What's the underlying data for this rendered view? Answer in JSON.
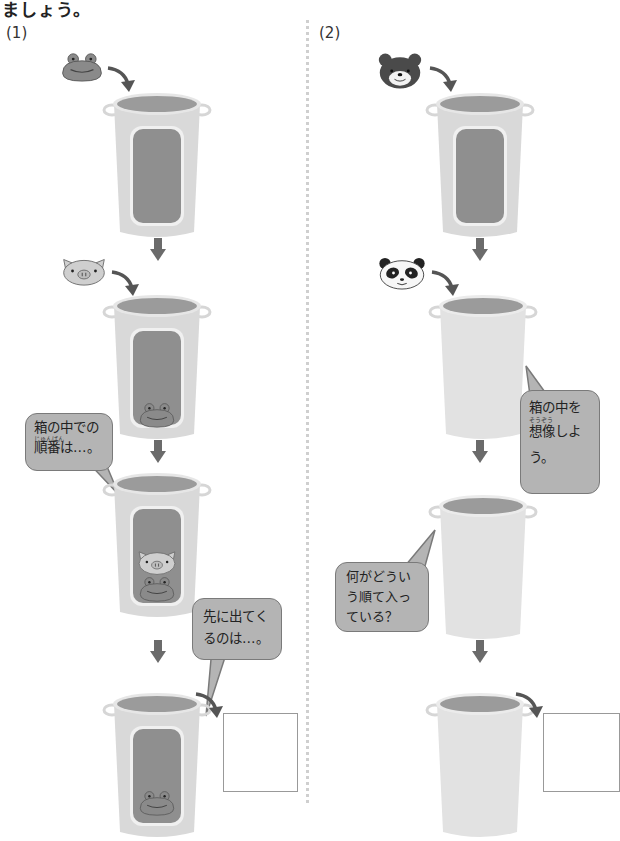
{
  "header": {
    "text": "ましょう。"
  },
  "panels": [
    {
      "label": "(1)",
      "steps": [
        {
          "animal": "frog",
          "action": "goes into box"
        },
        {
          "animal": "pig",
          "action": "goes into box",
          "box_contents": [
            "frog"
          ]
        },
        {
          "box_contents": [
            "frog",
            "pig"
          ]
        },
        {
          "box_contents": [
            "frog"
          ],
          "output": "answer-box"
        }
      ],
      "bubbles": [
        {
          "ruby": "じゅんばん",
          "lines": [
            "箱の中での",
            "順番は…。"
          ]
        },
        {
          "lines": [
            "先に出てく",
            "るのは…。"
          ]
        }
      ]
    },
    {
      "label": "(2)",
      "steps": [
        {
          "animal": "bear",
          "action": "goes into box"
        },
        {
          "animal": "panda",
          "action": "goes into box"
        },
        {
          "box_contents": []
        },
        {
          "box_contents": [],
          "output": "answer-box"
        }
      ],
      "bubbles": [
        {
          "ruby": "そうぞう",
          "lines": [
            "箱の中を",
            "想像しよ",
            "う。"
          ]
        },
        {
          "lines": [
            "何がどうい",
            "う順て入っ",
            "ている？"
          ]
        }
      ]
    }
  ],
  "colors": {
    "bin_body": "#d9d9d9",
    "bin_rim": "#9b9b9b",
    "window": "#8f8f8f",
    "arrow": "#6b6b6b",
    "bubble_fill": "#b4b4b4"
  }
}
